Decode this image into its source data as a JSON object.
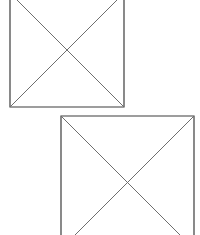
{
  "canvas": {
    "width": 200,
    "height": 235,
    "background_color": "#ffffff",
    "description": "Two outlined squares each crossed by both diagonals forming an X, offset diagonally; the upper square is cropped by the top image edge and the lower square is cropped by the bottom image edge"
  },
  "style": {
    "outline_color": "#3c3c3c",
    "diagonal_color": "#6e6e6e",
    "outline_width": 1.2,
    "diagonal_width": 1
  },
  "shapes": [
    {
      "id": "upper-square",
      "label": "Upper square with X diagonals",
      "left": 10,
      "right": 124,
      "top": -7,
      "bottom": 107,
      "side_length": 114,
      "center_x": 67,
      "center_y": 50,
      "cropped_edge": "top",
      "outline_color": "#3c3c3c",
      "diagonal_color": "#6e6e6e"
    },
    {
      "id": "lower-square",
      "label": "Lower square with X diagonals",
      "left": 61,
      "right": 194,
      "top": 116,
      "bottom": 249,
      "side_length": 133,
      "center_x": 127,
      "center_y": 182,
      "cropped_edge": "bottom",
      "outline_color": "#3c3c3c",
      "diagonal_color": "#6e6e6e"
    }
  ]
}
